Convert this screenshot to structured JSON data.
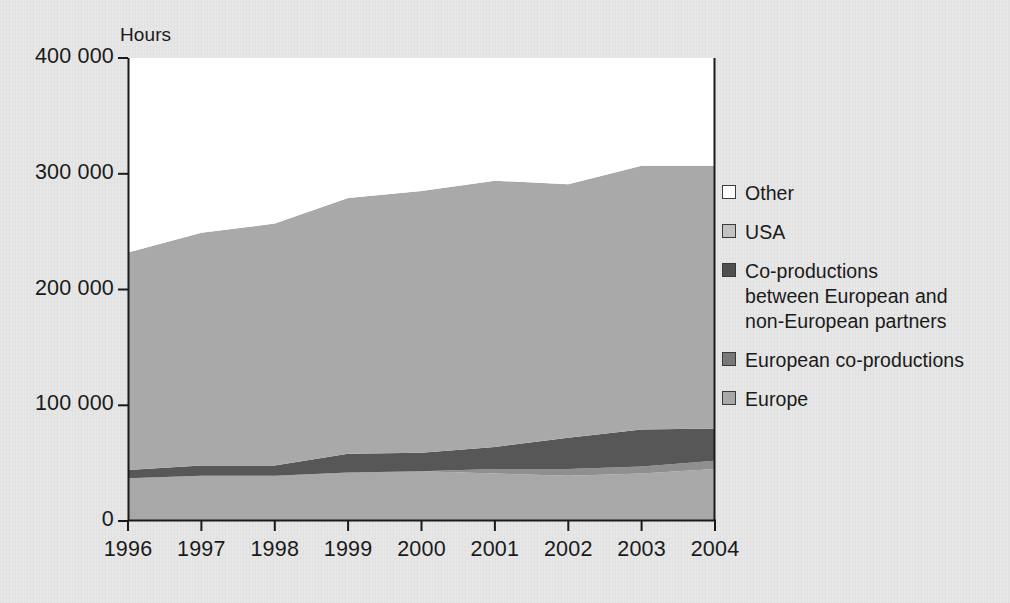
{
  "chart_data": {
    "type": "area",
    "stacked": true,
    "title": "",
    "subtitle": "",
    "xlabel": "",
    "ylabel": "Hours",
    "categories": [
      "1996",
      "1997",
      "1998",
      "1999",
      "2000",
      "2001",
      "2002",
      "2003",
      "2004"
    ],
    "x": [
      1996,
      1997,
      1998,
      1999,
      2000,
      2001,
      2002,
      2003,
      2004
    ],
    "ylim": [
      0,
      400000
    ],
    "ytick_values": [
      0,
      100000,
      200000,
      300000,
      400000
    ],
    "ytick_labels": [
      "0",
      "100 000",
      "200 000",
      "300 000",
      "400 000"
    ],
    "grid": false,
    "legend_position": "right",
    "series": [
      {
        "name": "Europe",
        "color": "#a8a8a8",
        "values": [
          37000,
          39000,
          39000,
          42000,
          43000,
          41000,
          39000,
          41000,
          45000
        ]
      },
      {
        "name": "European co-productions",
        "color": "#8f8f8f",
        "values": [
          0,
          0,
          0,
          0,
          0,
          4000,
          6000,
          6000,
          7000
        ]
      },
      {
        "name": "Co-productions between European and non-European partners",
        "color": "#575757",
        "values": [
          7000,
          9000,
          9000,
          16000,
          16000,
          19000,
          27000,
          32000,
          28000
        ]
      },
      {
        "name": "USA",
        "color": "#a9a9a9",
        "values": [
          188000,
          201000,
          209000,
          221000,
          226000,
          230000,
          219000,
          228000,
          227000
        ]
      },
      {
        "name": "Other",
        "color": "#ffffff",
        "values": [
          33000,
          34000,
          32000,
          40000,
          39000,
          38000,
          42000,
          48000,
          32000
        ]
      }
    ],
    "stack_tops": {
      "Europe": [
        37000,
        39000,
        39000,
        42000,
        43000,
        41000,
        39000,
        41000,
        45000
      ],
      "European co-productions": [
        37000,
        39000,
        39000,
        42000,
        43000,
        45000,
        45000,
        47000,
        52000
      ],
      "Co-productions": [
        44000,
        48000,
        48000,
        58000,
        59000,
        64000,
        72000,
        79000,
        80000
      ],
      "USA": [
        232000,
        249000,
        257000,
        279000,
        285000,
        294000,
        291000,
        307000,
        307000
      ],
      "Other": [
        265000,
        283000,
        289000,
        319000,
        324000,
        332000,
        333000,
        355000,
        339000
      ]
    }
  },
  "axes": {
    "ylabel": "Hours",
    "ytick_labels": [
      "400 000",
      "300 000",
      "200 000",
      "100 000",
      "0"
    ],
    "xtick_labels": [
      "1996",
      "1997",
      "1998",
      "1999",
      "2000",
      "2001",
      "2002",
      "2003",
      "2004"
    ]
  },
  "legend": {
    "items": [
      {
        "label": "Other",
        "color": "#ffffff"
      },
      {
        "label": "USA",
        "color": "#c2c2c2"
      },
      {
        "label": "Co-productions\nbetween European and\nnon-European partners",
        "color": "#4f4f4f"
      },
      {
        "label": "European co-productions",
        "color": "#787878"
      },
      {
        "label": "Europe",
        "color": "#a8a8a8"
      }
    ]
  },
  "colors": {
    "background": "#e7e7e7",
    "axis": "#1a1a1a",
    "plot_background": "#ffffff",
    "other": "#ffffff",
    "usa": "#b4b4b4",
    "coproductions_mixed": "#575757",
    "european_coproductions": "#8a8a8a",
    "europe": "#a5a5a5"
  }
}
